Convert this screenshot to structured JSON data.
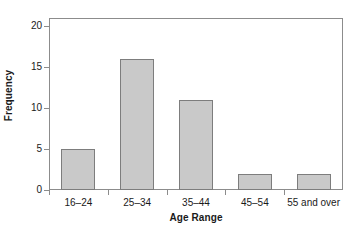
{
  "chart_data": {
    "type": "bar",
    "title": "",
    "xlabel": "Age Range",
    "ylabel": "Frequency",
    "categories": [
      "16–24",
      "25–34",
      "35–44",
      "45–54",
      "55 and over"
    ],
    "values": [
      5,
      16,
      11,
      2,
      2
    ],
    "ylim": [
      0,
      21
    ],
    "y_ticks": [
      0,
      5,
      10,
      15,
      20
    ],
    "y_tick_labels": [
      "0",
      "5",
      "10",
      "15",
      "20"
    ],
    "grid": false,
    "legend": null,
    "bar_fill_color": "#c9c9c9",
    "bar_edge_color": "#7d7d7d",
    "axis_color": "#8c8c8c",
    "background_color": "#ffffff"
  }
}
